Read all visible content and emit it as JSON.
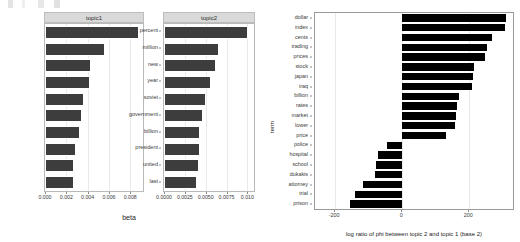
{
  "chart_data": [
    {
      "type": "bar",
      "orientation": "horizontal",
      "title": "topic1",
      "xlabel": "beta",
      "ylabel": "",
      "xlim": [
        0,
        0.0092
      ],
      "xticks": [
        0,
        0.002,
        0.004,
        0.006,
        0.008
      ],
      "xticklabels": [
        "0.000",
        "0.002",
        "0.004",
        "0.006",
        "0.008"
      ],
      "grid": true,
      "categories": [
        "i",
        "people",
        "police",
        "two",
        "years",
        "state",
        "new",
        "court",
        "last",
        "president"
      ],
      "values": [
        0.0088,
        0.0056,
        0.0043,
        0.0042,
        0.0037,
        0.0035,
        0.0033,
        0.0029,
        0.0027,
        0.0027
      ]
    },
    {
      "type": "bar",
      "orientation": "horizontal",
      "title": "topic2",
      "xlabel": "beta",
      "ylabel": "",
      "xlim": [
        0,
        0.0108
      ],
      "xticks": [
        0,
        0.0025,
        0.005,
        0.0075,
        0.01
      ],
      "xticklabels": [
        "0.0000",
        "0.0025",
        "0.0050",
        "0.0075",
        "0.010"
      ],
      "grid": true,
      "categories": [
        "percent",
        "million",
        "new",
        "year",
        "soviet",
        "government",
        "billion",
        "president",
        "united",
        "last"
      ],
      "values": [
        0.0101,
        0.0066,
        0.0062,
        0.0056,
        0.005,
        0.0047,
        0.0043,
        0.0043,
        0.0042,
        0.004
      ]
    },
    {
      "type": "bar",
      "orientation": "horizontal",
      "title": "",
      "xlabel": "log ratio of phi between topic 2 and topic 1 (base 2)",
      "ylabel": "term",
      "xlim": [
        -260,
        330
      ],
      "xticks": [
        -200,
        0,
        200
      ],
      "xticklabels": [
        "-200",
        "0",
        "200"
      ],
      "grid": true,
      "categories": [
        "dollar",
        "index",
        "cents",
        "trading",
        "prices",
        "stock",
        "japan",
        "iraq",
        "billion",
        "rates",
        "market",
        "lower",
        "price",
        "police",
        "hospital",
        "school",
        "dukakis",
        "attorney",
        "trial",
        "prison"
      ],
      "values": [
        308,
        305,
        266,
        254,
        246,
        215,
        210,
        208,
        168,
        163,
        160,
        158,
        130,
        -46,
        -73,
        -78,
        -80,
        -118,
        -142,
        -155
      ]
    }
  ],
  "beta_panel": {
    "axis_title": "beta",
    "facets": [
      "topic1",
      "topic2"
    ]
  },
  "logratio_panel": {
    "y_title": "term",
    "x_title": "log ratio of phi between topic 2 and topic 1 (base 2)"
  }
}
